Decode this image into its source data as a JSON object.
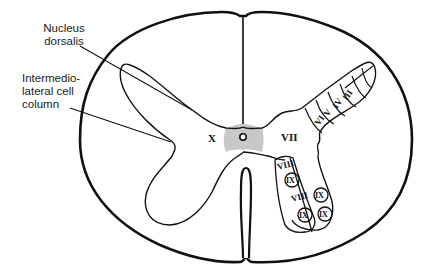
{
  "figure": {
    "colors": {
      "outline": "#111111",
      "commissure_fill": "#c8c8c8",
      "background": "#ffffff"
    }
  },
  "labels": {
    "nucleus_dorsalis": [
      "Nucleus",
      "dorsalis"
    ],
    "intermediolateral": [
      "Intermedio-",
      "lateral cell",
      "column"
    ]
  },
  "laminae": {
    "I": "I",
    "II": "II",
    "III": "III",
    "IV": "IV",
    "V": "V",
    "VI": "VI",
    "VII": "VII",
    "VIII_upper": "VIII",
    "VIII_lower": "VIII",
    "IX": "IX",
    "X": "X"
  }
}
